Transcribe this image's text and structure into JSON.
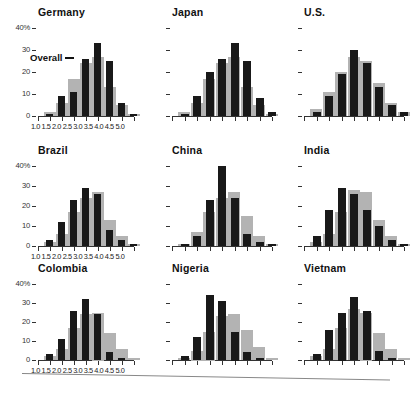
{
  "chart_data": {
    "type": "bar",
    "title": "",
    "xlabel": "",
    "ylabel": "",
    "ylim": [
      0,
      40
    ],
    "grid": false,
    "legend_position": "inline-annotation",
    "x_tick_labels": [
      "1.0",
      "1.5",
      "2.0",
      "2.5",
      "3.0",
      "3.5",
      "4.0",
      "4.5",
      "5.0"
    ],
    "y_tick_labels": [
      "0",
      "10",
      "20",
      "30",
      "40%"
    ],
    "y_tick_values": [
      0,
      10,
      20,
      30,
      40
    ],
    "bin_centers": [
      1.25,
      1.75,
      2.25,
      2.75,
      3.25,
      3.75,
      4.25,
      4.75
    ],
    "series_names": [
      "Overall",
      "Country"
    ],
    "series_colors": {
      "overall": "#b3b3b3",
      "country": "#191919"
    },
    "annotation": "Overall",
    "panels": [
      {
        "name": "Germany",
        "show_y_labels": true,
        "show_x_labels": true,
        "overall": [
          2,
          6,
          17,
          24,
          27,
          13,
          5,
          1
        ],
        "country": [
          1,
          9,
          11,
          26,
          33,
          25,
          6,
          1
        ]
      },
      {
        "name": "Japan",
        "show_y_labels": false,
        "show_x_labels": false,
        "overall": [
          2,
          6,
          17,
          24,
          27,
          13,
          5,
          1
        ],
        "country": [
          1,
          9,
          20,
          26,
          33,
          25,
          8,
          2
        ]
      },
      {
        "name": "U.S.",
        "show_y_labels": false,
        "show_x_labels": false,
        "overall": [
          3,
          11,
          20,
          27,
          25,
          15,
          6,
          2
        ],
        "country": [
          2,
          9,
          19,
          30,
          24,
          13,
          5,
          2
        ]
      },
      {
        "name": "Brazil",
        "show_y_labels": true,
        "show_x_labels": true,
        "overall": [
          2,
          6,
          17,
          24,
          27,
          13,
          5,
          1
        ],
        "country": [
          3,
          12,
          23,
          29,
          26,
          8,
          3,
          1
        ]
      },
      {
        "name": "China",
        "show_y_labels": false,
        "show_x_labels": false,
        "overall": [
          1,
          7,
          17,
          24,
          27,
          15,
          5,
          1
        ],
        "country": [
          1,
          5,
          23,
          40,
          24,
          6,
          2,
          1
        ]
      },
      {
        "name": "India",
        "show_y_labels": false,
        "show_x_labels": false,
        "overall": [
          2,
          6,
          17,
          28,
          27,
          13,
          5,
          1
        ],
        "country": [
          5,
          18,
          29,
          26,
          18,
          10,
          3,
          1
        ]
      },
      {
        "name": "Colombia",
        "show_y_labels": true,
        "show_x_labels": true,
        "overall": [
          2,
          6,
          17,
          24,
          25,
          14,
          6,
          1
        ],
        "country": [
          3,
          11,
          26,
          32,
          24,
          4,
          1,
          0
        ]
      },
      {
        "name": "Nigeria",
        "show_y_labels": false,
        "show_x_labels": false,
        "overall": [
          1,
          5,
          15,
          23,
          24,
          16,
          7,
          1
        ],
        "country": [
          2,
          12,
          34,
          31,
          15,
          4,
          1,
          0
        ]
      },
      {
        "name": "Vietnam",
        "show_y_labels": false,
        "show_x_labels": false,
        "overall": [
          2,
          6,
          17,
          27,
          25,
          14,
          6,
          1
        ],
        "country": [
          3,
          16,
          25,
          33,
          26,
          5,
          1,
          0
        ]
      }
    ]
  }
}
